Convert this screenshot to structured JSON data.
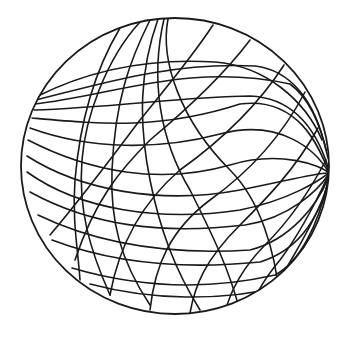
{
  "figure": {
    "subject": "wireframe sphere line drawing",
    "stroke_color": "#1a1a1a",
    "background_color": "#ffffff",
    "outline": {
      "cx": 175,
      "cy": 166,
      "rx": 154,
      "ry": 148
    },
    "family_a_curves": [
      "M38 96 C90 70 150 58 215 62 C265 66 305 100 322 140",
      "M36 100 C100 84 170 62 255 66 C290 70 315 100 326 150",
      "M35 104 C110 96 190 62 290 84 C312 100 322 130 328 158",
      "M34 110 C110 108 190 96 250 96 C300 98 320 140 329 170",
      "M32 118 C100 124 160 130 240 104 C300 96 320 150 329 172",
      "M30 128 C90 150 160 150 220 134 C280 118 316 150 329 173",
      "M28 140 C90 172 160 185 230 165 C280 150 320 165 329 173",
      "M27 156 C80 190 160 205 240 190 C290 180 320 172 329 173",
      "M27 172 C80 210 160 222 240 210 C290 200 320 180 329 173",
      "M30 192 C90 225 160 235 245 225 C290 218 318 190 329 174",
      "M38 215 C100 245 170 255 250 250 C290 240 318 205 329 176",
      "M52 240 C110 262 180 270 260 262 C300 250 320 215 329 178",
      "M72 268 C130 285 200 292 275 275 C300 262 318 225 328 182",
      "M90 284 C150 300 220 302 285 286 C305 270 320 235 327 190"
    ],
    "family_b_curves": [
      "M120 28 C95 70 80 120 75 180 C72 220 78 250 80 280",
      "M140 22 C105 60 85 120 82 160 C78 210 90 250 110 295",
      "M150 20 C130 60 115 100 112 170 C110 220 120 260 150 305",
      "M158 19 C140 70 138 120 150 180 C160 230 175 270 200 310",
      "M164 19 C150 80 160 140 190 190 C210 230 230 270 240 312",
      "M168 19 C160 60 180 120 230 170 C260 200 275 250 280 300",
      "M213 25 C190 60 160 95 140 120 C110 160 80 200 50 235",
      "M250 40 C220 80 180 115 150 140 C120 170 95 200 75 260",
      "M284 65 C255 110 215 145 180 170 C145 200 120 240 110 295",
      "M305 92 C280 140 245 175 210 200 C170 230 155 265 150 310",
      "M318 128 C295 170 265 200 240 225 C205 260 195 285 190 313",
      "M326 160 C305 200 285 225 265 245 C245 265 230 290 225 313",
      "M328 176 C310 215 295 240 280 260 C265 278 255 295 250 310",
      "M327 190 C312 225 300 245 290 262 C280 280 272 295 268 305"
    ]
  }
}
